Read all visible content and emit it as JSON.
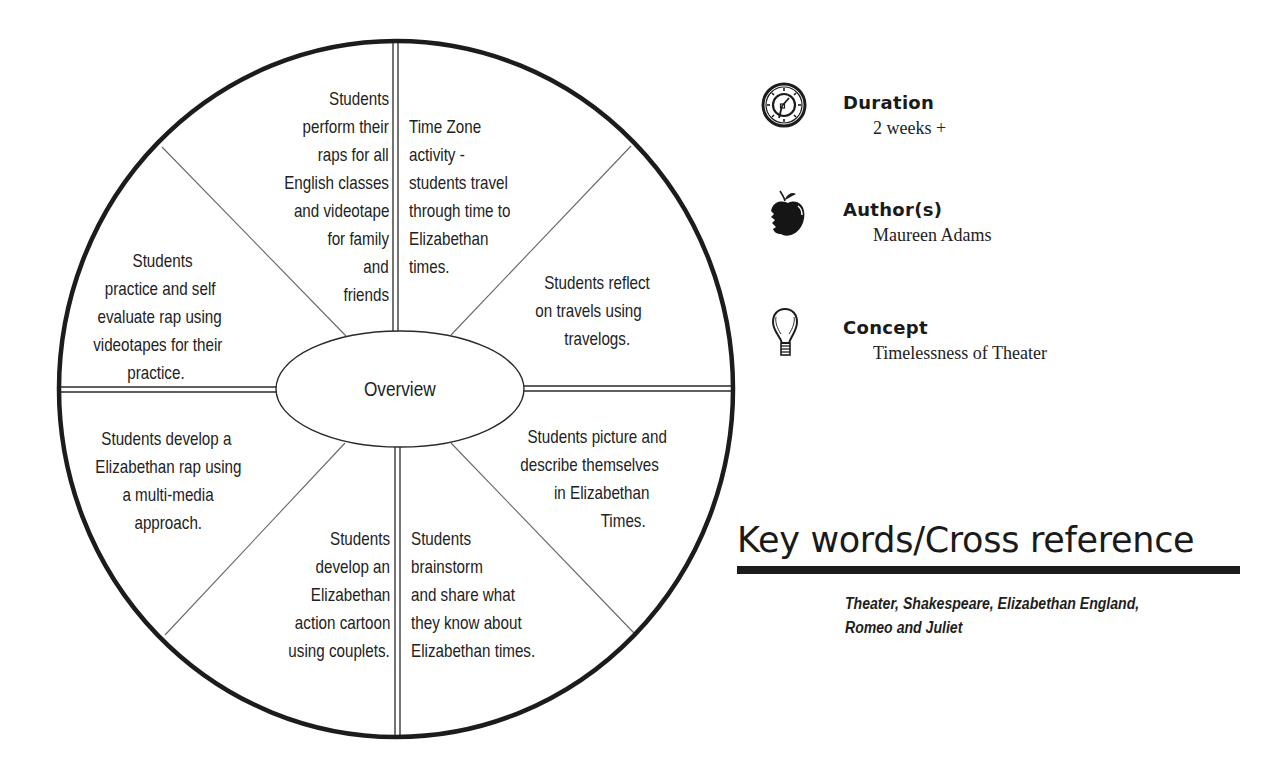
{
  "diagram": {
    "center_label": "Overview",
    "segments": [
      {
        "id": "perform-raps",
        "align": "right",
        "anchor_x": 389,
        "lines": [
          {
            "text": "Students",
            "y": 88
          },
          {
            "text": "perform their",
            "y": 116
          },
          {
            "text": "raps for all",
            "y": 144
          },
          {
            "text": "English classes",
            "y": 172
          },
          {
            "text": "and videotape",
            "y": 200
          },
          {
            "text": "for family",
            "y": 228
          },
          {
            "text": "and",
            "y": 256
          },
          {
            "text": "friends",
            "y": 284
          }
        ]
      },
      {
        "id": "time-zone",
        "align": "left",
        "anchor_x": 409,
        "lines": [
          {
            "text": "Time Zone",
            "y": 116
          },
          {
            "text": "activity -",
            "y": 144
          },
          {
            "text": "students travel",
            "y": 172
          },
          {
            "text": "through time to",
            "y": 200
          },
          {
            "text": "Elizabethan",
            "y": 228
          },
          {
            "text": "times.",
            "y": 256
          }
        ]
      },
      {
        "id": "reflect-travels",
        "align": "center",
        "anchor_x": 597,
        "lines": [
          {
            "text": "Students reflect",
            "y": 272,
            "dx": 0
          },
          {
            "text": "on travels using",
            "y": 300,
            "dx": -8
          },
          {
            "text": "travelogs.",
            "y": 328,
            "dx": 0
          }
        ]
      },
      {
        "id": "picture-describe",
        "align": "center",
        "anchor_x": 597,
        "lines": [
          {
            "text": "Students picture and",
            "y": 426,
            "dx": 0
          },
          {
            "text": "describe themselves",
            "y": 454,
            "dx": -7
          },
          {
            "text": "in Elizabethan",
            "y": 482,
            "dx": 5
          },
          {
            "text": "Times.",
            "y": 510,
            "dx": 26
          }
        ]
      },
      {
        "id": "brainstorm-share",
        "align": "left",
        "anchor_x": 411,
        "lines": [
          {
            "text": "Students",
            "y": 528
          },
          {
            "text": "brainstorm",
            "y": 556
          },
          {
            "text": "and share what",
            "y": 584
          },
          {
            "text": "they know about",
            "y": 612
          },
          {
            "text": "Elizabethan times.",
            "y": 640
          }
        ]
      },
      {
        "id": "action-cartoon",
        "align": "right",
        "anchor_x": 390,
        "lines": [
          {
            "text": "Students",
            "y": 528
          },
          {
            "text": "develop an",
            "y": 556
          },
          {
            "text": "Elizabethan",
            "y": 584
          },
          {
            "text": "action cartoon",
            "y": 612
          },
          {
            "text": "using couplets.",
            "y": 640
          }
        ]
      },
      {
        "id": "develop-rap",
        "align": "center",
        "anchor_x": 168,
        "lines": [
          {
            "text": "Students develop a",
            "y": 428,
            "dx": -2
          },
          {
            "text": "Elizabethan rap using",
            "y": 456,
            "dx": 0
          },
          {
            "text": "a multi-media",
            "y": 484,
            "dx": 0
          },
          {
            "text": "approach.",
            "y": 512,
            "dx": 0
          }
        ]
      },
      {
        "id": "practice-evaluate",
        "align": "center",
        "anchor_x": 160,
        "lines": [
          {
            "text": "Students",
            "y": 250,
            "dx": 2
          },
          {
            "text": "practice and self",
            "y": 278,
            "dx": 0
          },
          {
            "text": "evaluate rap using",
            "y": 306,
            "dx": 0
          },
          {
            "text": "videotapes for their",
            "y": 334,
            "dx": -2
          },
          {
            "text": "practice.",
            "y": 362,
            "dx": -4
          }
        ]
      }
    ]
  },
  "info": {
    "duration": {
      "label": "Duration",
      "value": "2 weeks +",
      "icon": "compass-clock-icon"
    },
    "authors": {
      "label": "Author(s)",
      "value": "Maureen Adams",
      "icon": "apple-icon"
    },
    "concept": {
      "label": "Concept",
      "value": "Timelessness of Theater",
      "icon": "lightbulb-icon"
    }
  },
  "keywords": {
    "heading": "Key words/Cross reference",
    "lines": [
      "Theater, Shakespeare, Elizabethan England,",
      "Romeo and Juliet"
    ]
  },
  "colors": {
    "ink": "#1e1e1e",
    "thin_line": "#555555",
    "background": "#ffffff"
  }
}
